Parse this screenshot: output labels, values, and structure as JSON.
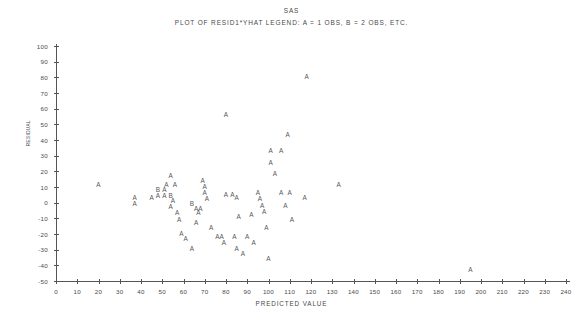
{
  "titles": {
    "main": "SAS",
    "sub": "PLOT OF RESID1*YHAT   LEGEND: A = 1 OBS, B = 2 OBS, ETC."
  },
  "axis": {
    "y_title": "RESIDUAL",
    "x_title": "PREDICTED VALUE",
    "y_ticks": [
      "100",
      "90",
      "80",
      "70",
      "60",
      "50",
      "40",
      "30",
      "20",
      "10",
      "0",
      "-10",
      "-20",
      "-30",
      "-40",
      "-50"
    ],
    "x_ticks": [
      "0",
      "10",
      "20",
      "30",
      "40",
      "50",
      "60",
      "70",
      "80",
      "90",
      "100",
      "110",
      "120",
      "130",
      "140",
      "150",
      "160",
      "170",
      "180",
      "190",
      "200",
      "210",
      "220",
      "230",
      "240"
    ]
  },
  "colors": {
    "axis": "#555555",
    "text": "#4a4a4a",
    "marker": "#555555",
    "background": "#ffffff"
  },
  "chart_data": {
    "type": "scatter",
    "title": "SAS",
    "subtitle": "PLOT OF RESID1*YHAT   LEGEND: A = 1 OBS, B = 2 OBS, ETC.",
    "xlabel": "PREDICTED VALUE",
    "ylabel": "RESIDUAL",
    "xlim": [
      0,
      240
    ],
    "ylim": [
      -50,
      100
    ],
    "xtick_step": 10,
    "ytick_step": 10,
    "grid": false,
    "legend": "A = 1 OBS, B = 2 OBS, ETC.",
    "marker_legend": {
      "A": 1,
      "B": 2
    },
    "points": [
      {
        "x": 20,
        "y": 11,
        "label": "A"
      },
      {
        "x": 37,
        "y": 3,
        "label": "A"
      },
      {
        "x": 37,
        "y": -1,
        "label": "A"
      },
      {
        "x": 45,
        "y": 3,
        "label": "A"
      },
      {
        "x": 48,
        "y": 8,
        "label": "B"
      },
      {
        "x": 51,
        "y": 8,
        "label": "A"
      },
      {
        "x": 48,
        "y": 4,
        "label": "A"
      },
      {
        "x": 51,
        "y": 4,
        "label": "A"
      },
      {
        "x": 54,
        "y": 17,
        "label": "A"
      },
      {
        "x": 52,
        "y": 11,
        "label": "A"
      },
      {
        "x": 56,
        "y": 11,
        "label": "A"
      },
      {
        "x": 54,
        "y": 4,
        "label": "B"
      },
      {
        "x": 55,
        "y": 1,
        "label": "A"
      },
      {
        "x": 54,
        "y": -3,
        "label": "A"
      },
      {
        "x": 57,
        "y": -7,
        "label": "A"
      },
      {
        "x": 58,
        "y": -11,
        "label": "A"
      },
      {
        "x": 59,
        "y": -20,
        "label": "A"
      },
      {
        "x": 61,
        "y": -23,
        "label": "A"
      },
      {
        "x": 64,
        "y": -1,
        "label": "B"
      },
      {
        "x": 66,
        "y": -4,
        "label": "A"
      },
      {
        "x": 68,
        "y": -4,
        "label": "A"
      },
      {
        "x": 67,
        "y": -7,
        "label": "A"
      },
      {
        "x": 66,
        "y": -13,
        "label": "A"
      },
      {
        "x": 64,
        "y": -30,
        "label": "A"
      },
      {
        "x": 69,
        "y": 14,
        "label": "A"
      },
      {
        "x": 70,
        "y": 10,
        "label": "A"
      },
      {
        "x": 70,
        "y": 6,
        "label": "A"
      },
      {
        "x": 71,
        "y": 2,
        "label": "A"
      },
      {
        "x": 73,
        "y": -16,
        "label": "A"
      },
      {
        "x": 76,
        "y": -22,
        "label": "A"
      },
      {
        "x": 78,
        "y": -22,
        "label": "A"
      },
      {
        "x": 79,
        "y": -26,
        "label": "A"
      },
      {
        "x": 80,
        "y": 56,
        "label": "A"
      },
      {
        "x": 80,
        "y": 5,
        "label": "A"
      },
      {
        "x": 83,
        "y": 5,
        "label": "A"
      },
      {
        "x": 85,
        "y": 3,
        "label": "A"
      },
      {
        "x": 86,
        "y": -9,
        "label": "A"
      },
      {
        "x": 84,
        "y": -22,
        "label": "A"
      },
      {
        "x": 85,
        "y": -30,
        "label": "A"
      },
      {
        "x": 88,
        "y": -33,
        "label": "A"
      },
      {
        "x": 90,
        "y": -22,
        "label": "A"
      },
      {
        "x": 92,
        "y": -8,
        "label": "A"
      },
      {
        "x": 93,
        "y": -26,
        "label": "A"
      },
      {
        "x": 95,
        "y": 6,
        "label": "A"
      },
      {
        "x": 96,
        "y": 2,
        "label": "A"
      },
      {
        "x": 97,
        "y": -2,
        "label": "A"
      },
      {
        "x": 98,
        "y": -6,
        "label": "A"
      },
      {
        "x": 99,
        "y": -16,
        "label": "A"
      },
      {
        "x": 100,
        "y": -36,
        "label": "A"
      },
      {
        "x": 101,
        "y": 25,
        "label": "A"
      },
      {
        "x": 103,
        "y": 18,
        "label": "A"
      },
      {
        "x": 101,
        "y": 33,
        "label": "A"
      },
      {
        "x": 106,
        "y": 33,
        "label": "A"
      },
      {
        "x": 109,
        "y": 43,
        "label": "A"
      },
      {
        "x": 106,
        "y": 6,
        "label": "A"
      },
      {
        "x": 110,
        "y": 6,
        "label": "A"
      },
      {
        "x": 108,
        "y": -2,
        "label": "A"
      },
      {
        "x": 111,
        "y": -11,
        "label": "A"
      },
      {
        "x": 118,
        "y": 80,
        "label": "A"
      },
      {
        "x": 117,
        "y": 3,
        "label": "A"
      },
      {
        "x": 133,
        "y": 11,
        "label": "A"
      },
      {
        "x": 195,
        "y": -43,
        "label": "A"
      }
    ]
  }
}
